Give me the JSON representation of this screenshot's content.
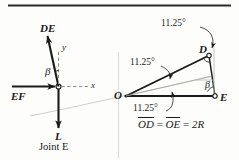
{
  "figure": {
    "title_rule": "top-horizontal-rule",
    "background_color": "#fdfdfb",
    "ink_color": "#1a1a1a",
    "faint_color": "#b9b9b4"
  },
  "left_diagram": {
    "caption": "Joint E",
    "force_up_label": "DE",
    "force_left_label": "EF",
    "force_down_label": "L",
    "angle_label": "β",
    "axis_y_label": "y",
    "axis_x_label": "x"
  },
  "right_diagram": {
    "point_o": "O",
    "point_d": "D",
    "point_e": "E",
    "angle_beta": "β",
    "angle_top": "11.25°",
    "angle_middle": "11.25°",
    "angle_bottom": "11.25°",
    "relation": {
      "od": "OD",
      "oe": "OE",
      "equals_1": "=",
      "equals_2": "=",
      "value": "2R"
    }
  }
}
